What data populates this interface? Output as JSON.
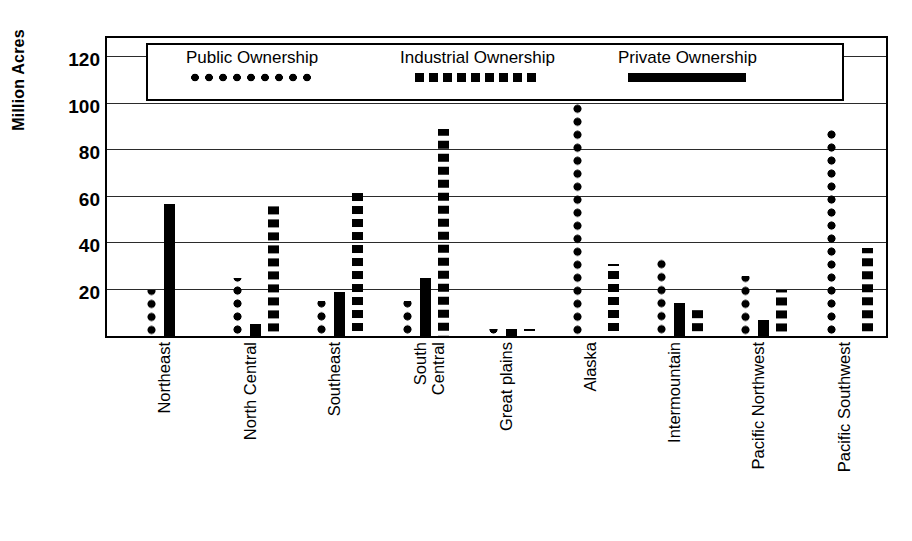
{
  "chart_data": {
    "type": "bar",
    "title": "",
    "subtitle": "",
    "xlabel": "",
    "ylabel": "Million Acres",
    "ylim": [
      0,
      130
    ],
    "yticks": [
      20,
      40,
      60,
      80,
      100,
      120
    ],
    "ytick_labels": [
      "20",
      "40",
      "60",
      "80",
      "100",
      "120"
    ],
    "grid": true,
    "legend_position": "top-inside",
    "categories": [
      "Northeast",
      "North Central",
      "Southeast",
      "South\nCentral",
      "Great plains",
      "Alaska",
      "Intermountain",
      "Pacific Northwest",
      "Pacific Southwest"
    ],
    "series": [
      {
        "name": "Public Ownership",
        "marker": "dotted",
        "color": "#000000",
        "values": [
          20,
          25,
          15,
          15,
          3,
          103,
          33,
          26,
          90
        ]
      },
      {
        "name": "Private Ownership",
        "marker": "solid",
        "color": "#000000",
        "values": [
          57,
          5,
          19,
          25,
          3,
          0,
          14,
          7,
          0
        ]
      },
      {
        "name": "Industrial Ownership",
        "marker": "dashed",
        "color": "#000000",
        "values": [
          0,
          57,
          62,
          89,
          3,
          31,
          13,
          20,
          38
        ]
      }
    ]
  },
  "legend": {
    "entries": [
      {
        "label": "Public Ownership",
        "swatch": "dotted-line-swatch"
      },
      {
        "label": "Industrial Ownership",
        "swatch": "dashed-line-swatch"
      },
      {
        "label": "Private Ownership",
        "swatch": "solid-line-swatch"
      }
    ]
  },
  "axis": {
    "y_title": "Million Acres"
  }
}
